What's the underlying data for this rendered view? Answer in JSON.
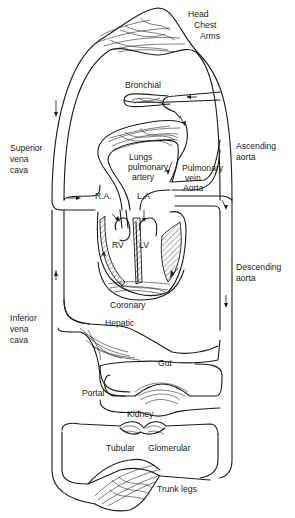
{
  "diagram": {
    "type": "circulatory-system-schematic",
    "colors": {
      "line": "#1a1a1a",
      "background": "#ffffff"
    },
    "labels": {
      "head": "Head",
      "chest": "Chest",
      "arms": "Arms",
      "bronchial": "Bronchial",
      "superior_vena_cava_1": "Superior",
      "superior_vena_cava_2": "vena",
      "superior_vena_cava_3": "cava",
      "ascending_aorta_1": "Ascending",
      "ascending_aorta_2": "aorta",
      "lungs_1": "Lungs",
      "lungs_2": "pulmonary",
      "lungs_3": "artery",
      "pulmonary_vein_1": "Pulmonary",
      "pulmonary_vein_2": "vein",
      "aorta": "Aorta",
      "ra": "R.A.",
      "la": "L.A",
      "rv": "RV",
      "lv": "LV",
      "descending_aorta_1": "Descending",
      "descending_aorta_2": "aorta",
      "coronary": "Coronary",
      "inferior_vena_cava_1": "Inferior",
      "inferior_vena_cava_2": "vena",
      "inferior_vena_cava_3": "cava",
      "hepatic": "Hepatic",
      "gut": "Gut",
      "portal": "Portal",
      "kidney": "Kidney",
      "tubular": "Tubular",
      "glomerular": "Glomerular",
      "trunk_legs": "Trunk legs"
    },
    "capillary_beds": [
      "Head Chest Arms",
      "Bronchial",
      "Lungs",
      "Coronary",
      "Hepatic",
      "Gut",
      "Tubular",
      "Glomerular",
      "Trunk legs"
    ],
    "heart_chambers": [
      "R.A.",
      "L.A",
      "RV",
      "LV"
    ]
  }
}
